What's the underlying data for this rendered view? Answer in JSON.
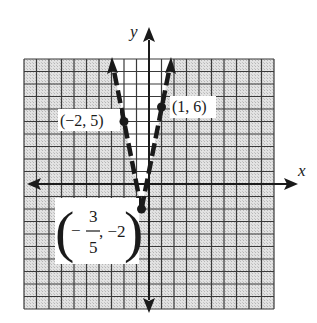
{
  "graph": {
    "title": "",
    "axis_labels": {
      "x": "x",
      "y": "y"
    },
    "x_range": [
      -10,
      10
    ],
    "y_range": [
      -10,
      10
    ],
    "grid_step": 1,
    "function": "y = 5|x + 3/5| - 2",
    "line_style": "dashed",
    "shading": "outside the V shaded, inside the V unshaded",
    "points": [
      {
        "id": "p1",
        "x": -2,
        "y": 5,
        "label": "(−2, 5)"
      },
      {
        "id": "p2",
        "x": 1,
        "y": 6,
        "label": "(1, 6)"
      },
      {
        "id": "vertex",
        "x": -0.6,
        "y": -2,
        "label_num": "3",
        "label_den": "5",
        "label_neg": "−",
        "label_y": ", −2"
      }
    ],
    "colors": {
      "grid_line": "#3a3a3a",
      "shade": "#d9d9d9",
      "ink": "#1a1a1a",
      "unshaded": "#ffffff"
    }
  }
}
